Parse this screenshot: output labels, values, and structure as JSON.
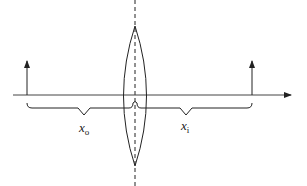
{
  "diagram": {
    "type": "thin-lens-ray-diagram",
    "elements": {
      "optical_axis": {
        "arrow": "right"
      },
      "lens": {
        "shape": "biconvex",
        "axis_line": "dashed-vertical"
      },
      "object_arrow": {
        "direction": "up",
        "position": "left"
      },
      "image_arrow": {
        "direction": "up",
        "position": "right"
      }
    },
    "labels": {
      "object_distance": {
        "base": "x",
        "subscript": "o"
      },
      "image_distance": {
        "base": "x",
        "subscript": "i"
      }
    },
    "colors": {
      "line": "#222222",
      "background": "#ffffff"
    }
  }
}
